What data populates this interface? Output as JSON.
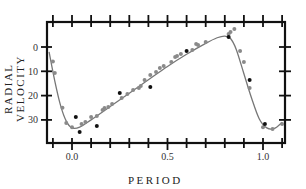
{
  "chart_data": {
    "type": "scatter",
    "title": "",
    "xlabel": "PERIOD",
    "ylabel": "RADIAL VELOCITY",
    "xlim": [
      -0.13,
      1.12
    ],
    "ylim": [
      38,
      -10
    ],
    "y_inverted": true,
    "x_ticks": [
      {
        "value": 0.0,
        "label": "0.0"
      },
      {
        "value": 0.5,
        "label": "0.5"
      },
      {
        "value": 1.0,
        "label": "1.0"
      }
    ],
    "y_ticks": [
      {
        "value": 0,
        "label": "0"
      },
      {
        "value": 10,
        "label": "10"
      },
      {
        "value": 20,
        "label": "20"
      },
      {
        "value": 30,
        "label": "30"
      }
    ],
    "grid": false,
    "legend": null,
    "series": [
      {
        "name": "gray observations",
        "color": "#8a8a8a",
        "points": [
          [
            -0.1,
            6
          ],
          [
            -0.09,
            10.7
          ],
          [
            -0.05,
            25
          ],
          [
            -0.03,
            31.3
          ],
          [
            0.0,
            33
          ],
          [
            0.05,
            31.7
          ],
          [
            0.07,
            30.9
          ],
          [
            0.1,
            28.8
          ],
          [
            0.13,
            28.4
          ],
          [
            0.16,
            25.9
          ],
          [
            0.17,
            25.1
          ],
          [
            0.19,
            24.7
          ],
          [
            0.21,
            23.5
          ],
          [
            0.26,
            21
          ],
          [
            0.29,
            19.3
          ],
          [
            0.32,
            17.7
          ],
          [
            0.35,
            16.9
          ],
          [
            0.36,
            16
          ],
          [
            0.38,
            13.6
          ],
          [
            0.41,
            11.5
          ],
          [
            0.44,
            10.3
          ],
          [
            0.46,
            8.6
          ],
          [
            0.48,
            7.8
          ],
          [
            0.52,
            6.2
          ],
          [
            0.54,
            4.1
          ],
          [
            0.55,
            3.7
          ],
          [
            0.57,
            2.9
          ],
          [
            0.63,
            1.2
          ],
          [
            0.65,
            -1.2
          ],
          [
            0.66,
            -0.8
          ],
          [
            0.7,
            -2.1
          ],
          [
            0.82,
            -5.3
          ],
          [
            0.83,
            -6.2
          ],
          [
            0.85,
            -7.4
          ],
          [
            0.88,
            1.6
          ],
          [
            0.9,
            6.2
          ],
          [
            0.93,
            16.9
          ],
          [
            1.0,
            33
          ],
          [
            1.05,
            33.7
          ],
          [
            1.1,
            31.7
          ]
        ]
      },
      {
        "name": "black observations",
        "color": "#111111",
        "points": [
          [
            0.02,
            28.8
          ],
          [
            0.04,
            35
          ],
          [
            0.13,
            32.5
          ],
          [
            0.25,
            18.9
          ],
          [
            0.41,
            16.5
          ],
          [
            0.6,
            1.6
          ],
          [
            0.82,
            -4.1
          ],
          [
            0.93,
            13.6
          ],
          [
            1.01,
            31.7
          ]
        ]
      },
      {
        "name": "fitted curve",
        "type": "line",
        "color": "#777777",
        "points": [
          [
            -0.12,
            2
          ],
          [
            -0.09,
            14
          ],
          [
            -0.06,
            24
          ],
          [
            -0.03,
            30.5
          ],
          [
            0.0,
            33.3
          ],
          [
            0.04,
            33
          ],
          [
            0.1,
            30
          ],
          [
            0.2,
            24.5
          ],
          [
            0.3,
            19
          ],
          [
            0.4,
            13.5
          ],
          [
            0.5,
            8
          ],
          [
            0.6,
            3
          ],
          [
            0.7,
            -1.5
          ],
          [
            0.76,
            -3.8
          ],
          [
            0.8,
            -4.5
          ],
          [
            0.83,
            -3.5
          ],
          [
            0.86,
            1
          ],
          [
            0.9,
            11
          ],
          [
            0.94,
            21
          ],
          [
            0.98,
            29.5
          ],
          [
            1.02,
            33.3
          ],
          [
            1.06,
            33.5
          ],
          [
            1.1,
            31
          ]
        ]
      }
    ]
  },
  "labels": {
    "ylabel": "RADIAL VELOCITY",
    "xlabel": "PERIOD"
  }
}
